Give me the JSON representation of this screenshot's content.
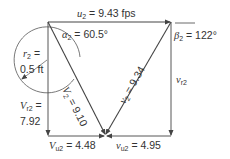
{
  "diagram": {
    "colors": {
      "line": "#444444",
      "text": "#333333",
      "background": "#ffffff"
    },
    "labels": {
      "u2": {
        "symbol": "u",
        "sub": "2",
        "value": "= 9.43 fps"
      },
      "alpha2": {
        "symbol": "α",
        "sub": "2",
        "value": "= 60.5°"
      },
      "beta2": {
        "symbol": "β",
        "sub": "2",
        "value": "= 122°"
      },
      "r2": {
        "symbol": "r",
        "sub": "2",
        "eq": "=",
        "value": "0.5 ft"
      },
      "V2": {
        "symbol": "V",
        "sub": "2",
        "value": "= 9.10"
      },
      "v2": {
        "symbol": "v",
        "sub": "2",
        "value": "= 9.34"
      },
      "Vr2": {
        "symbol": "V",
        "sub": "r2",
        "eq": "=",
        "value": "7.92"
      },
      "vr2": {
        "symbol": "v",
        "sub": "r2"
      },
      "Vu2": {
        "symbol": "V",
        "sub": "u2",
        "value": "= 4.48"
      },
      "vu2": {
        "symbol": "v",
        "sub": "u2",
        "value": "= 4.95"
      }
    }
  }
}
